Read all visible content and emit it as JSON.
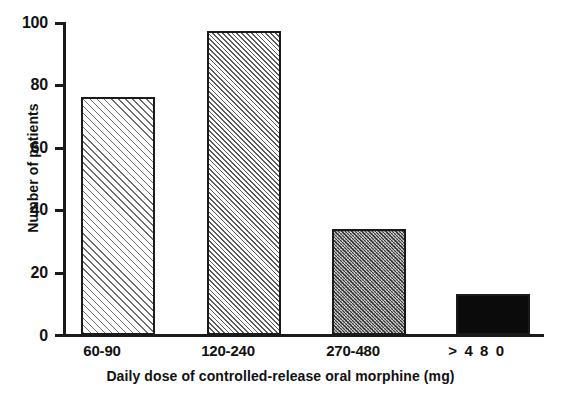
{
  "chart_data": {
    "type": "bar",
    "title": "",
    "xlabel": "Daily dose of controlled-release oral morphine (mg)",
    "ylabel": "Number of patients",
    "categories": [
      "60-90",
      "120-240",
      "270-480",
      "> 4 8 0"
    ],
    "values": [
      76,
      97,
      34,
      13
    ],
    "ylim": [
      0,
      100
    ],
    "yticks": [
      0,
      20,
      40,
      60,
      80,
      100
    ],
    "ytick_labels": [
      "0",
      "20",
      "40",
      "60",
      "80",
      "100"
    ],
    "grid": false,
    "legend": false,
    "series": [
      {
        "name": "Number of patients",
        "values": [
          76,
          97,
          34,
          13
        ]
      }
    ],
    "bar_fills": [
      "hatch-light",
      "hatch-medium",
      "hatch-dense",
      "solid-black"
    ],
    "colors": {
      "axis": "#1a1a1a",
      "bar_outline": "#1a1a1a",
      "bar4_fill": "#0b0b0b",
      "background": "#ffffff",
      "text": "#111111"
    }
  },
  "axes": {
    "y_title": "Number of patients",
    "x_title": "Daily dose of controlled-release oral morphine (mg)",
    "y_ticks": [
      {
        "label": "100",
        "value": 100
      },
      {
        "label": "80",
        "value": 80
      },
      {
        "label": "60",
        "value": 60
      },
      {
        "label": "40",
        "value": 40
      },
      {
        "label": "20",
        "value": 20
      },
      {
        "label": "0",
        "value": 0
      }
    ]
  },
  "bars": [
    {
      "label": "60-90",
      "value": 76
    },
    {
      "label": "120-240",
      "value": 97
    },
    {
      "label": "270-480",
      "value": 34
    },
    {
      "label": "> 4 8 0",
      "value": 13
    }
  ]
}
